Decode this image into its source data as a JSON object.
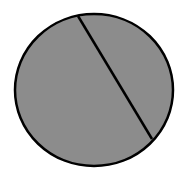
{
  "diagram": {
    "shape": "circle-with-chord",
    "background": "#ffffff",
    "circle": {
      "cx": 94,
      "cy": 90,
      "rx": 79,
      "ry": 76,
      "fill": "#8c8c8c",
      "stroke": "#000000",
      "stroke_width": 2.5
    },
    "chord": {
      "x1": 78,
      "y1": 16,
      "x2": 152,
      "y2": 139,
      "stroke": "#000000",
      "stroke_width": 2.5
    }
  }
}
